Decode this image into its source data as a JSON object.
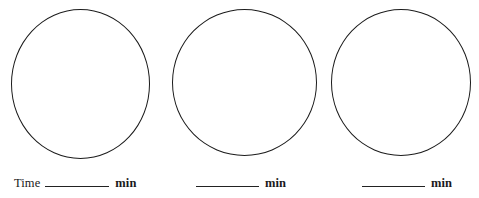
{
  "document": {
    "type": "worksheet",
    "background_color": "#ffffff",
    "stroke_color": "#1b1b1b"
  },
  "clocks": [
    {
      "id": "clock-1",
      "face_label": "",
      "answer": {
        "prefix": "Time",
        "value": "",
        "unit": "min"
      }
    },
    {
      "id": "clock-2",
      "face_label": "",
      "answer": {
        "prefix": "",
        "value": "",
        "unit": "min"
      }
    },
    {
      "id": "clock-3",
      "face_label": "",
      "answer": {
        "prefix": "",
        "value": "",
        "unit": "min"
      }
    }
  ]
}
